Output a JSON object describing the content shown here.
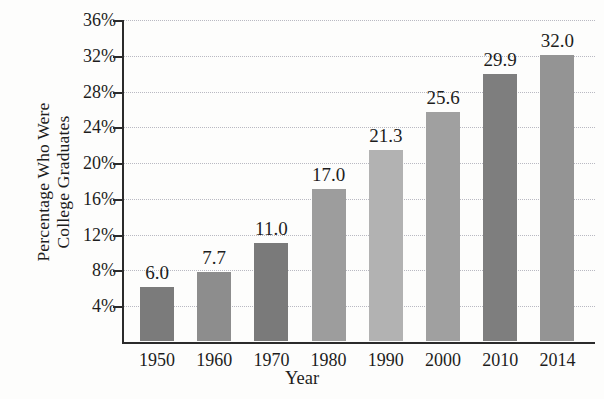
{
  "chart_data": {
    "type": "bar",
    "title": "",
    "xlabel": "Year",
    "ylabel": "Percentage Who Were College Graduates",
    "ylabel_line1": "Percentage Who Were",
    "ylabel_line2": "College Graduates",
    "categories": [
      "1950",
      "1960",
      "1970",
      "1980",
      "1990",
      "2000",
      "2010",
      "2014"
    ],
    "values": [
      6.0,
      7.7,
      11.0,
      17.0,
      21.3,
      25.6,
      29.9,
      32.0
    ],
    "value_labels": [
      "6.0",
      "7.7",
      "11.0",
      "17.0",
      "21.3",
      "25.6",
      "29.9",
      "32.0"
    ],
    "bar_colors": [
      "#7b7b7b",
      "#8d8d8d",
      "#7a7a7a",
      "#9d9d9d",
      "#b2b2b2",
      "#a0a0a0",
      "#7e7e7e",
      "#949494"
    ],
    "ylim": [
      0,
      36
    ],
    "yticks": [
      4,
      8,
      12,
      16,
      20,
      24,
      28,
      32,
      36
    ],
    "ytick_labels": [
      "4%",
      "8%",
      "12%",
      "16%",
      "20%",
      "24%",
      "28%",
      "32%",
      "36%"
    ],
    "grid": true,
    "grid_color": "#b9b9c2",
    "legend": "none",
    "axis_color": "#2b2b2b",
    "background": "#fdfdfc"
  }
}
